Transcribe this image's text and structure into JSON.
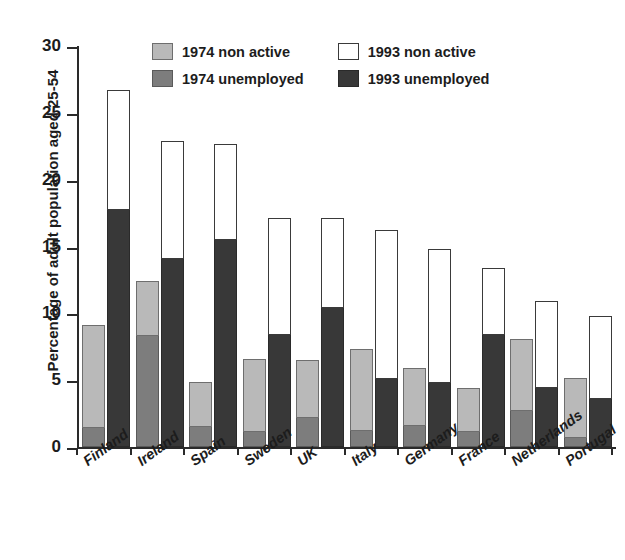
{
  "chart_data": {
    "type": "bar",
    "title": "",
    "subtitle": "",
    "xlabel": "",
    "ylabel": "Percentage of adult population aged 25-54",
    "ylim": [
      0,
      30
    ],
    "yticks": [
      0,
      5,
      10,
      15,
      20,
      25,
      30
    ],
    "grid": false,
    "stacked": true,
    "legend_position": "top-center",
    "categories": [
      "Finland",
      "Ireland",
      "Spain",
      "Sweden",
      "UK",
      "Italy",
      "Germany",
      "France",
      "Netherlands",
      "Portugal"
    ],
    "series": [
      {
        "name": "1974 unemployed",
        "color": "#7d7d7d",
        "values": [
          1.4,
          8.3,
          1.5,
          1.1,
          2.2,
          1.2,
          1.6,
          1.1,
          2.7,
          0.7
        ]
      },
      {
        "name": "1974 non active",
        "color": "#b9b9b9",
        "values": [
          7.7,
          4.1,
          3.4,
          5.5,
          4.3,
          6.1,
          4.3,
          3.3,
          5.4,
          4.5
        ]
      },
      {
        "name": "1993 unemployed",
        "color": "#383838",
        "values": [
          17.7,
          14.1,
          15.5,
          8.4,
          10.4,
          5.1,
          4.8,
          8.4,
          4.4,
          3.6
        ]
      },
      {
        "name": "1993 non active",
        "color": "#ffffff",
        "values": [
          9.0,
          8.8,
          7.2,
          8.7,
          6.7,
          11.1,
          10.0,
          5.0,
          6.5,
          6.2
        ]
      }
    ],
    "totals_1974": [
      9.1,
      12.4,
      4.9,
      6.6,
      6.5,
      7.3,
      5.9,
      4.4,
      8.1,
      5.2
    ],
    "totals_1993": [
      26.7,
      22.9,
      22.7,
      17.1,
      17.1,
      16.2,
      14.8,
      13.4,
      10.9,
      9.8
    ]
  },
  "legend": {
    "items": [
      {
        "label": "1974 non active",
        "swatch": "light-gray-swatch"
      },
      {
        "label": "1974 unemployed",
        "swatch": "medium-gray-swatch"
      },
      {
        "label": "1993 non active",
        "swatch": "white-swatch"
      },
      {
        "label": "1993 unemployed",
        "swatch": "dark-gray-swatch"
      }
    ]
  },
  "colors": {
    "nonactive_1974": "#b9b9b9",
    "unemployed_1974": "#7d7d7d",
    "nonactive_1993": "#ffffff",
    "unemployed_1993": "#383838",
    "axis": "#2a2a2a"
  }
}
